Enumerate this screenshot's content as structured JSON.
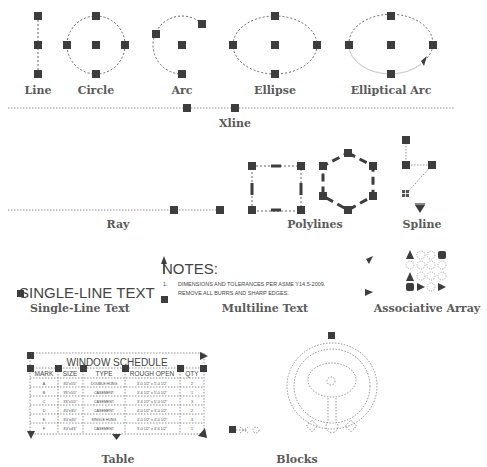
{
  "labels": {
    "line": "Line",
    "circle": "Circle",
    "arc": "Arc",
    "ellipse": "Ellipse",
    "elliptical_arc": "Elliptical Arc",
    "xline": "Xline",
    "ray": "Ray",
    "polylines": "Polylines",
    "spline": "Spline",
    "single_line_text": "Single-Line Text",
    "multiline_text": "Multiline Text",
    "associative_array": "Associative Array",
    "table": "Table",
    "blocks": "Blocks"
  },
  "single_line_text": {
    "content": "SINGLE-LINE TEXT"
  },
  "multiline_text": {
    "heading": "NOTES:",
    "line1_num": "1.",
    "line1": "DIMENSIONS AND TOLERANCES PER ASME Y14.5-2009.",
    "line2_num": "2.",
    "line2": "REMOVE ALL BURRS AND SHARP EDGES."
  },
  "table": {
    "title": "WINDOW SCHEDULE",
    "headers": [
      "MARK",
      "SIZE",
      "TYPE",
      "ROUGH OPEN",
      "QTY"
    ],
    "rows": [
      [
        "A",
        "3'0\"x5'0\"",
        "DOUBLE HUNG",
        "3'-0 1/2\" x 5'-0 1/2\"",
        "2"
      ],
      [
        "B",
        "3'6\"x5'0\"",
        "CASEMENT",
        "3'-6 1/2\" x 5'-0 1/2\"",
        "1"
      ],
      [
        "C",
        "3'6\"x5'0\"",
        "CASEMENT",
        "3'-6 1/2\" x 5'-0 1/2\"",
        "3"
      ],
      [
        "D",
        "4'0\"x3'0\"",
        "CASEMENT",
        "4'-0 1/2\" x 3'-0 1/2\"",
        "2"
      ],
      [
        "E",
        "3'0\"x4'0\"",
        "SINGLE HUNG",
        "3'-0 1/2\" x 4'-0 1/2\"",
        "3"
      ],
      [
        "F",
        "3'0\"x4'6\"",
        "CASEMENT",
        "3'-0 1/2\" x 4'-6 1/2\"",
        "1"
      ]
    ]
  },
  "colors": {
    "grip": "#3d3d3d",
    "dash": "#666666",
    "label": "#5a5a5a"
  }
}
